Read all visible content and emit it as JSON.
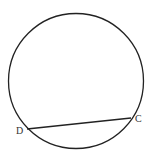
{
  "diagram": {
    "type": "circle-with-chord",
    "circle": {
      "cx": 76,
      "cy": 81,
      "r": 67.5,
      "stroke": "#222222"
    },
    "chord": {
      "from": "D",
      "to": "C"
    },
    "points": [
      {
        "name": "D",
        "label": "D",
        "x": 27,
        "y": 129,
        "label_x": 16,
        "label_y": 134
      },
      {
        "name": "C",
        "label": "C",
        "x": 131,
        "y": 118,
        "label_x": 135,
        "label_y": 122
      }
    ]
  }
}
